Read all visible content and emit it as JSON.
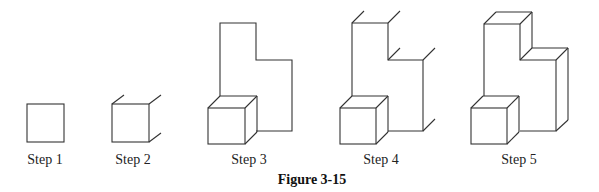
{
  "figure": {
    "caption": "Figure 3-15",
    "line_color": "#333333",
    "steps": [
      {
        "label": "Step 1",
        "x": 45
      },
      {
        "label": "Step 2",
        "x": 133
      },
      {
        "label": "Step 3",
        "x": 249
      },
      {
        "label": "Step 4",
        "x": 381
      },
      {
        "label": "Step 5",
        "x": 519
      }
    ]
  }
}
